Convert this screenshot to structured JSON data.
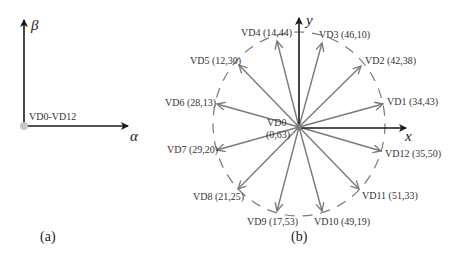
{
  "panel_a": {
    "caption": "(a)",
    "y_axis_label": "β",
    "x_axis_label": "α",
    "origin_label": "VD0-VD12",
    "origin_color": "#c8c8c8"
  },
  "panel_b": {
    "caption": "(b)",
    "y_axis_label": "y",
    "x_axis_label": "x",
    "center_label_line1": "VD0",
    "center_label_line2": "(0,63)",
    "vectors": [
      {
        "name": "VD1",
        "label": "VD1 (34,43)"
      },
      {
        "name": "VD2",
        "label": "VD2 (42,38)"
      },
      {
        "name": "VD3",
        "label": "VD3 (46,10)"
      },
      {
        "name": "VD4",
        "label": "VD4 (14,44)"
      },
      {
        "name": "VD5",
        "label": "VD5 (12,30)"
      },
      {
        "name": "VD6",
        "label": "VD6 (28,13)"
      },
      {
        "name": "VD7",
        "label": "VD7 (29,20)"
      },
      {
        "name": "VD8",
        "label": "VD8 (21,25)"
      },
      {
        "name": "VD9",
        "label": "VD9 (17,53)"
      },
      {
        "name": "VD10",
        "label": "VD10 (49,19)"
      },
      {
        "name": "VD11",
        "label": "VD11 (51,33)"
      },
      {
        "name": "VD12",
        "label": "VD12 (35,50)"
      }
    ],
    "vector_color": "#7a7a7a",
    "axis_color": "#1a1a1a",
    "circle_style": "dashed"
  }
}
